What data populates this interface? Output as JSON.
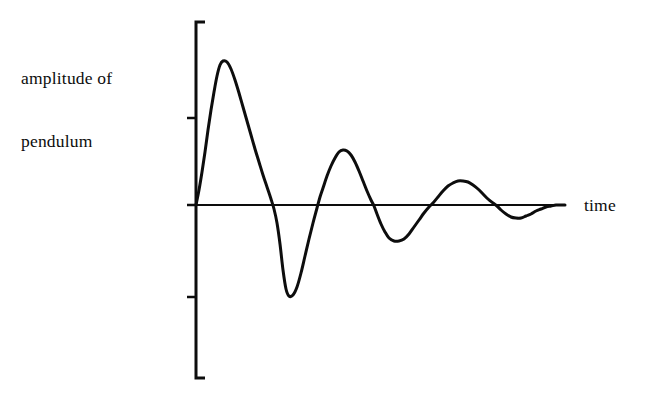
{
  "figure": {
    "background_color": "#ffffff",
    "ink_color": "#0d0d0d",
    "width": 649,
    "height": 403
  },
  "labels": {
    "y_axis_line1": "amplitude of",
    "y_axis_line2": "pendulum",
    "x_axis": "time"
  },
  "chart_data": {
    "type": "line",
    "title": "",
    "subtitle": "",
    "xlabel": "time",
    "ylabel": "amplitude of pendulum",
    "grid": false,
    "legend": null,
    "annotations": [],
    "xlim": [
      0,
      1
    ],
    "ylim": [
      -1,
      1
    ],
    "axis_tick_labels": {
      "x": [],
      "y": []
    },
    "series": [
      {
        "name": "pendulum amplitude",
        "color": "#0d0d0d",
        "line_width": 3,
        "extrema": [
          {
            "kind": "origin",
            "x": 0.0,
            "y": 0.0
          },
          {
            "kind": "peak",
            "x": 0.065,
            "y": 1.0
          },
          {
            "kind": "zero",
            "x": 0.155,
            "y": 0.0
          },
          {
            "kind": "trough",
            "x": 0.242,
            "y": -0.63
          },
          {
            "kind": "zero",
            "x": 0.32,
            "y": 0.0
          },
          {
            "kind": "peak",
            "x": 0.399,
            "y": 0.385
          },
          {
            "kind": "zero",
            "x": 0.48,
            "y": 0.0
          },
          {
            "kind": "trough",
            "x": 0.567,
            "y": -0.245
          },
          {
            "kind": "zero",
            "x": 0.642,
            "y": 0.0
          },
          {
            "kind": "peak",
            "x": 0.722,
            "y": 0.168
          },
          {
            "kind": "zero",
            "x": 0.8,
            "y": 0.0
          },
          {
            "kind": "trough",
            "x": 0.866,
            "y": -0.091
          },
          {
            "kind": "zero",
            "x": 0.934,
            "y": 0.0
          },
          {
            "kind": "end",
            "x": 1.0,
            "y": 0.0
          }
        ],
        "path_points": [
          [
            196,
            205
          ],
          [
            199,
            190
          ],
          [
            202,
            172
          ],
          [
            205,
            152
          ],
          [
            208,
            130
          ],
          [
            211,
            110
          ],
          [
            214,
            92
          ],
          [
            217,
            76
          ],
          [
            220,
            65
          ],
          [
            223,
            61
          ],
          [
            227,
            62
          ],
          [
            231,
            69
          ],
          [
            235,
            80
          ],
          [
            239,
            93
          ],
          [
            243,
            107
          ],
          [
            247,
            121
          ],
          [
            251,
            135
          ],
          [
            255,
            149
          ],
          [
            259,
            162
          ],
          [
            263,
            175
          ],
          [
            267,
            187
          ],
          [
            271,
            199
          ],
          [
            274,
            209
          ],
          [
            277,
            223
          ],
          [
            280,
            244
          ],
          [
            283,
            270
          ],
          [
            286,
            289
          ],
          [
            289,
            296
          ],
          [
            293,
            295
          ],
          [
            297,
            287
          ],
          [
            301,
            273
          ],
          [
            305,
            256
          ],
          [
            309,
            239
          ],
          [
            313,
            223
          ],
          [
            317,
            208
          ],
          [
            320,
            197
          ],
          [
            323,
            188
          ],
          [
            327,
            176
          ],
          [
            331,
            166
          ],
          [
            335,
            158
          ],
          [
            339,
            152
          ],
          [
            343,
            150
          ],
          [
            347,
            151
          ],
          [
            351,
            155
          ],
          [
            355,
            162
          ],
          [
            359,
            171
          ],
          [
            363,
            181
          ],
          [
            367,
            191
          ],
          [
            371,
            200
          ],
          [
            374,
            206
          ],
          [
            377,
            214
          ],
          [
            381,
            224
          ],
          [
            385,
            232
          ],
          [
            389,
            238
          ],
          [
            394,
            241
          ],
          [
            399,
            241
          ],
          [
            404,
            239
          ],
          [
            409,
            234
          ],
          [
            414,
            227
          ],
          [
            419,
            220
          ],
          [
            424,
            213
          ],
          [
            429,
            207
          ],
          [
            433,
            203
          ],
          [
            438,
            197
          ],
          [
            443,
            191
          ],
          [
            448,
            186
          ],
          [
            453,
            183
          ],
          [
            458,
            181
          ],
          [
            463,
            181
          ],
          [
            468,
            182
          ],
          [
            473,
            185
          ],
          [
            478,
            189
          ],
          [
            483,
            194
          ],
          [
            488,
            199
          ],
          [
            493,
            203
          ],
          [
            497,
            206
          ],
          [
            501,
            210
          ],
          [
            506,
            214
          ],
          [
            511,
            217
          ],
          [
            516,
            218
          ],
          [
            521,
            218
          ],
          [
            526,
            216
          ],
          [
            531,
            214
          ],
          [
            536,
            211
          ],
          [
            541,
            209
          ],
          [
            546,
            207
          ],
          [
            551,
            206
          ],
          [
            556,
            205
          ],
          [
            561,
            205
          ],
          [
            565,
            205
          ]
        ]
      }
    ],
    "axes": {
      "y_axis": {
        "x": 196,
        "y_top": 22,
        "y_bottom": 378,
        "cap_style": "serif-right",
        "cap_length": 9,
        "ticks": [
          {
            "y": 118,
            "direction": "left",
            "length": 9
          },
          {
            "y": 205,
            "direction": "left",
            "length": 9
          },
          {
            "y": 297,
            "direction": "left",
            "length": 9
          }
        ]
      },
      "x_axis": {
        "y": 205,
        "x_left": 188,
        "x_right": 565,
        "ticks": []
      }
    }
  }
}
